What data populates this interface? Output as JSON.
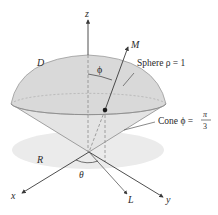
{
  "figure": {
    "axes": {
      "x": "x",
      "y": "y",
      "z": "z"
    },
    "labels": {
      "D": "D",
      "M": "M",
      "L": "L",
      "R": "R",
      "phi": "ϕ",
      "theta": "θ",
      "sphere": "Sphere ρ = 1",
      "cone_prefix": "Cone ϕ =",
      "cone_num": "π",
      "cone_den": "3"
    },
    "colors": {
      "solid_fill": "#d9d9d9",
      "solid_stroke": "#9a9a9a",
      "region_fill": "#ebebeb",
      "line": "#3a3a3a",
      "dashed": "#8a8a8a"
    }
  }
}
